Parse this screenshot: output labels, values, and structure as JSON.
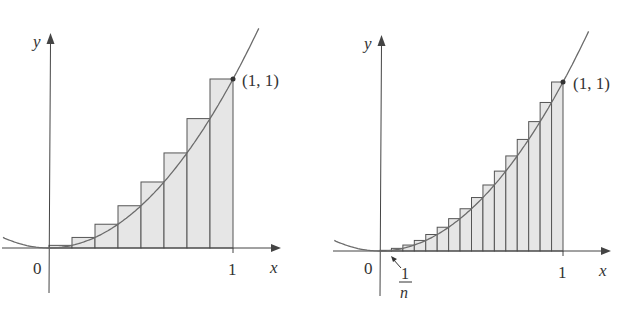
{
  "colors": {
    "rect_fill": "#e6e6e6",
    "rect_stroke": "#555555",
    "curve": "#6b6b6b",
    "axis": "#444444",
    "text": "#333333"
  },
  "chart_data": [
    {
      "type": "bar",
      "title": "",
      "description": "Right-endpoint rectangles under y = x^2 on [0,1], n = 8",
      "function": "y = x^2",
      "n": 8,
      "xlabel": "x",
      "ylabel": "y",
      "xlim": [
        -0.25,
        1.25
      ],
      "ylim": [
        -0.1,
        1.25
      ],
      "grid": false,
      "x_ticks": [
        "0",
        "1"
      ],
      "categories": [
        "1/8",
        "2/8",
        "3/8",
        "4/8",
        "5/8",
        "6/8",
        "7/8",
        "8/8"
      ],
      "values": [
        0.015625,
        0.0625,
        0.140625,
        0.25,
        0.390625,
        0.5625,
        0.765625,
        1.0
      ],
      "annotations": [
        "(1, 1)"
      ]
    },
    {
      "type": "bar",
      "title": "",
      "description": "Right-endpoint rectangles under y = x^2 on [0,1], n = 16",
      "function": "y = x^2",
      "n": 16,
      "xlabel": "x",
      "ylabel": "y",
      "xlim": [
        -0.25,
        1.25
      ],
      "ylim": [
        -0.1,
        1.25
      ],
      "grid": false,
      "x_ticks": [
        "0",
        "1"
      ],
      "categories": [
        "1/16",
        "2/16",
        "3/16",
        "4/16",
        "5/16",
        "6/16",
        "7/16",
        "8/16",
        "9/16",
        "10/16",
        "11/16",
        "12/16",
        "13/16",
        "14/16",
        "15/16",
        "16/16"
      ],
      "values": [
        0.0039,
        0.0156,
        0.0352,
        0.0625,
        0.0977,
        0.1406,
        0.1914,
        0.25,
        0.3164,
        0.3906,
        0.4727,
        0.5625,
        0.6602,
        0.7656,
        0.8789,
        1.0
      ],
      "annotations": [
        "(1, 1)",
        "1/n"
      ]
    }
  ],
  "left": {
    "y_label": "y",
    "x_label": "x",
    "origin_label": "0",
    "one_label": "1",
    "point_label": "(1, 1)"
  },
  "right": {
    "y_label": "y",
    "x_label": "x",
    "origin_label": "0",
    "one_label": "1",
    "point_label": "(1, 1)",
    "frac_num": "1",
    "frac_den": "n"
  }
}
